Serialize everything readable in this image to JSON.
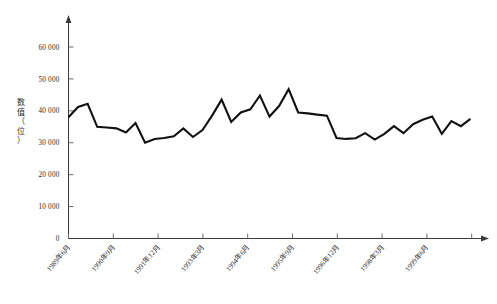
{
  "chart_data": {
    "type": "line",
    "title": "",
    "xlabel": "",
    "ylabel": "数值（位）",
    "ylim": [
      0,
      65000
    ],
    "yticks": [
      0,
      10000,
      20000,
      30000,
      40000,
      50000,
      60000
    ],
    "ytick_labels": [
      "0",
      "10 000",
      "20 000",
      "30 000",
      "40 000",
      "50 000",
      "60 000"
    ],
    "xtick_labels": [
      "1989年6月",
      "1990年9月",
      "1991年12月",
      "1993年3月",
      "1994年6月",
      "1995年9月",
      "1996年12月",
      "1998年3月",
      "1999年6月"
    ],
    "grid": false,
    "legend": "none",
    "series": [
      {
        "name": "数值",
        "values": [
          38000,
          41200,
          42200,
          35000,
          34800,
          34500,
          33200,
          36200,
          30000,
          31200,
          31500,
          32000,
          34500,
          31800,
          34000,
          38500,
          43500,
          36500,
          39500,
          40500,
          44800,
          38200,
          41500,
          46800,
          39500,
          39200,
          38800,
          38500,
          31500,
          31200,
          31400,
          33000,
          31000,
          32800,
          35200,
          33000,
          35800,
          37200,
          38200,
          32800,
          36800,
          35200,
          37500
        ]
      }
    ]
  },
  "axes": {
    "y_title": "数值（位）",
    "origin_label": "0"
  }
}
